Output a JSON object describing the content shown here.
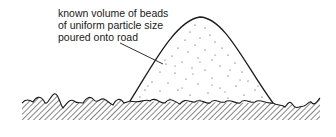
{
  "diagram": {
    "label_lines": [
      "known volume of beads",
      "of uniform particle size",
      "poured onto road"
    ],
    "colors": {
      "line": "#1a1a1a",
      "stipple": "#333333",
      "background": "#ffffff"
    },
    "elements": [
      "mound of beads",
      "rough road surface",
      "leader line"
    ]
  }
}
